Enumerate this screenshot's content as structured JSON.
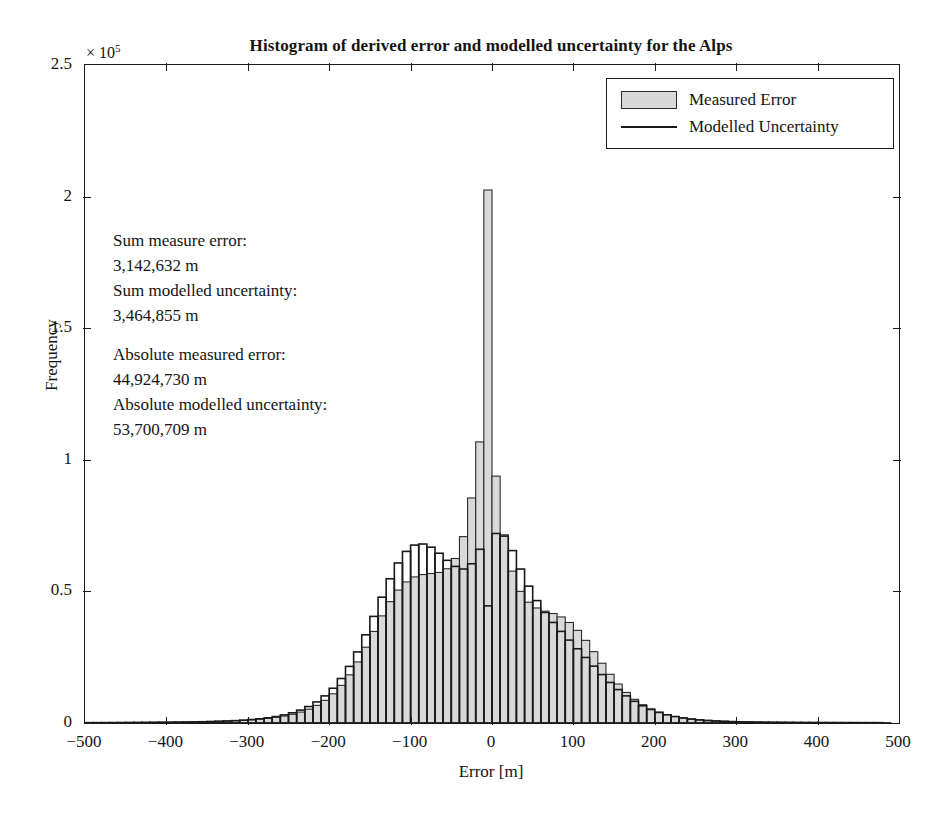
{
  "chart_data": {
    "type": "bar",
    "title": "Histogram of derived error and modelled uncertainty for the Alps",
    "xlabel": "Error [m]",
    "ylabel": "Frequency",
    "y_exponent_prefix": "× 10",
    "y_exponent_power": "5",
    "y_multiplier": 100000,
    "xlim": [
      -500,
      500
    ],
    "ylim": [
      0,
      250000
    ],
    "xticks": [
      -500,
      -400,
      -300,
      -200,
      -100,
      0,
      100,
      200,
      300,
      400,
      500
    ],
    "xtick_labels": [
      "−500",
      "−400",
      "−300",
      "−200",
      "−100",
      "0",
      "100",
      "200",
      "300",
      "400",
      "500"
    ],
    "yticks": [
      0,
      50000,
      100000,
      150000,
      200000,
      250000
    ],
    "ytick_labels": [
      "0",
      "0.5",
      "1",
      "1.5",
      "2",
      "2.5"
    ],
    "grid": false,
    "legend_position": "top-right",
    "bin_width": 10,
    "bin_centers": [
      -495,
      -485,
      -475,
      -465,
      -455,
      -445,
      -435,
      -425,
      -415,
      -405,
      -395,
      -385,
      -375,
      -365,
      -355,
      -345,
      -335,
      -325,
      -315,
      -305,
      -295,
      -285,
      -275,
      -265,
      -255,
      -245,
      -235,
      -225,
      -215,
      -205,
      -195,
      -185,
      -175,
      -165,
      -155,
      -145,
      -135,
      -125,
      -115,
      -105,
      -95,
      -85,
      -75,
      -65,
      -55,
      -45,
      -35,
      -25,
      -15,
      -5,
      5,
      15,
      25,
      35,
      45,
      55,
      65,
      75,
      85,
      95,
      105,
      115,
      125,
      135,
      145,
      155,
      165,
      175,
      185,
      195,
      205,
      215,
      225,
      235,
      245,
      255,
      265,
      275,
      285,
      295,
      305,
      315,
      325,
      335,
      345,
      355,
      365,
      375,
      385,
      395,
      405,
      415,
      425,
      435,
      445,
      455,
      465,
      475,
      485,
      495
    ],
    "series": [
      {
        "name": "Measured Error",
        "style": "filled-bar",
        "fill": "#d9d9d9",
        "edge": "#2b2b2b",
        "values": [
          150,
          160,
          170,
          180,
          190,
          210,
          230,
          250,
          270,
          300,
          330,
          360,
          400,
          450,
          510,
          580,
          660,
          760,
          880,
          1030,
          1220,
          1460,
          1760,
          2150,
          2650,
          3300,
          4150,
          5250,
          6700,
          8600,
          11100,
          14300,
          18300,
          23200,
          28800,
          34800,
          40700,
          46100,
          50500,
          53600,
          55500,
          56400,
          56800,
          57200,
          58600,
          62500,
          70800,
          85500,
          106800,
          202500,
          93800,
          71500,
          57700,
          50000,
          45900,
          43700,
          42500,
          41600,
          40300,
          38200,
          35200,
          31400,
          27100,
          22700,
          18500,
          14800,
          11600,
          9000,
          6950,
          5350,
          4120,
          3180,
          2480,
          1950,
          1550,
          1250,
          1020,
          850,
          710,
          600,
          520,
          450,
          400,
          355,
          320,
          290,
          265,
          245,
          230,
          215,
          205,
          195,
          185,
          178,
          172,
          166,
          160,
          155,
          150
        ]
      },
      {
        "name": "Modelled Uncertainty",
        "style": "outline-bar",
        "fill": "none",
        "edge": "#1a1a1a",
        "values": [
          130,
          140,
          150,
          160,
          175,
          190,
          205,
          225,
          245,
          270,
          300,
          335,
          375,
          425,
          485,
          560,
          650,
          760,
          900,
          1080,
          1310,
          1600,
          1970,
          2450,
          3070,
          3870,
          4900,
          6250,
          8000,
          10300,
          13200,
          16900,
          21500,
          27000,
          33500,
          40500,
          47800,
          54800,
          60800,
          65200,
          67600,
          68000,
          66800,
          64500,
          61800,
          59500,
          58500,
          60500,
          66000,
          44500,
          72000,
          71000,
          65500,
          58500,
          52000,
          46500,
          42000,
          38200,
          34800,
          31500,
          28200,
          24900,
          21600,
          18400,
          15400,
          12700,
          10300,
          8250,
          6550,
          5150,
          4020,
          3130,
          2430,
          1890,
          1480,
          1160,
          920,
          740,
          605,
          500,
          420,
          360,
          315,
          280,
          252,
          230,
          212,
          198,
          186,
          176,
          168,
          160,
          154,
          148,
          143,
          138,
          134,
          130
        ]
      }
    ],
    "annotations": [
      {
        "text": "Sum measure error:"
      },
      {
        "text": "3,142,632 m"
      },
      {
        "text": "Sum modelled uncertainty:"
      },
      {
        "text": "3,464,855 m"
      },
      {
        "text": ""
      },
      {
        "text": "Absolute measured error:"
      },
      {
        "text": "44,924,730 m"
      },
      {
        "text": "Absolute modelled uncertainty:"
      },
      {
        "text": "53,700,709 m"
      }
    ]
  },
  "legend": {
    "items": [
      {
        "label": "Measured Error",
        "marker": "filled-square-swatch"
      },
      {
        "label": "Modelled Uncertainty",
        "marker": "line-swatch"
      }
    ]
  },
  "colors": {
    "bar_fill": "#d9d9d9",
    "bar_edge": "#2b2b2b",
    "outline_edge": "#1a1a1a",
    "axis": "#1a1a1a",
    "text": "#141414",
    "background": "#ffffff"
  }
}
